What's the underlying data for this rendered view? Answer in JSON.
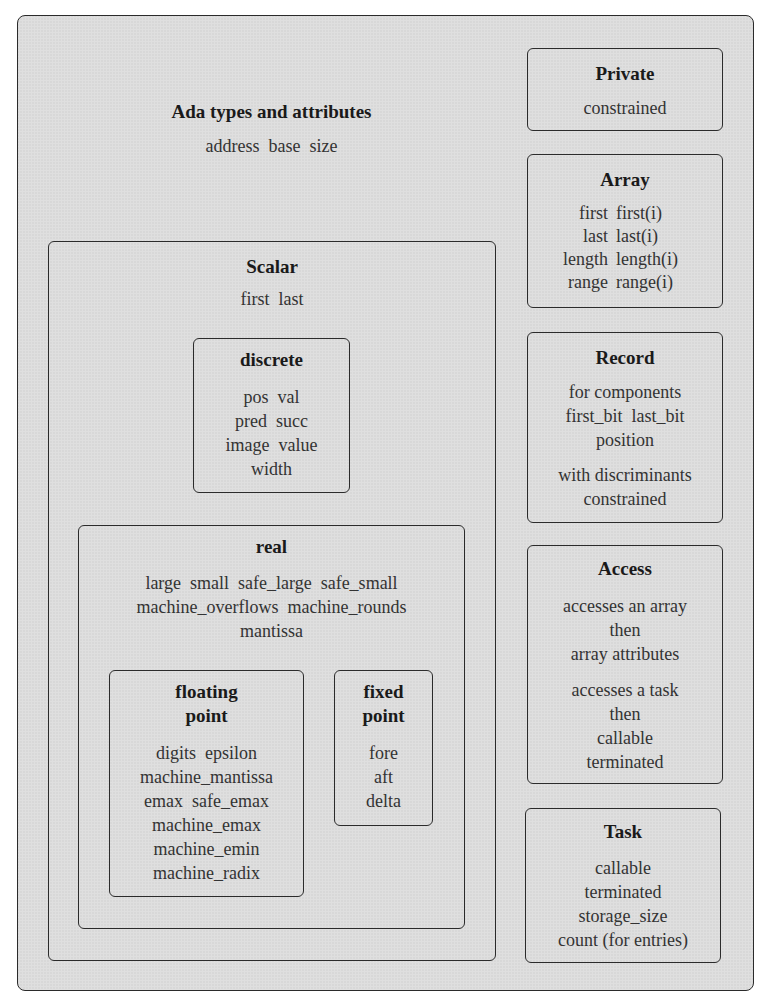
{
  "diagram": {
    "title": "Ada types and attributes",
    "common_attributes": [
      "address",
      "base",
      "size"
    ],
    "scalar": {
      "title": "Scalar",
      "attributes": [
        "first",
        "last"
      ],
      "discrete": {
        "title": "discrete",
        "lines": [
          "pos  val",
          "pred  succ",
          "image  value",
          "width"
        ]
      },
      "real": {
        "title": "real",
        "lines": [
          "large  small  safe_large  safe_small",
          "machine_overflows  machine_rounds",
          "mantissa"
        ],
        "floating_point": {
          "title_line1": "floating",
          "title_line2": "point",
          "lines": [
            "digits  epsilon",
            "machine_mantissa",
            "emax  safe_emax",
            "machine_emax",
            "machine_emin",
            "machine_radix"
          ]
        },
        "fixed_point": {
          "title_line1": "fixed",
          "title_line2": "point",
          "lines": [
            "fore",
            "aft",
            "delta"
          ]
        }
      }
    },
    "private": {
      "title": "Private",
      "lines": [
        "constrained"
      ]
    },
    "array": {
      "title": "Array",
      "rows": [
        {
          "left": "first",
          "right": "first(i)"
        },
        {
          "left": "last",
          "right": "last(i)"
        },
        {
          "left": "length",
          "right": "length(i)"
        },
        {
          "left": "range",
          "right": "range(i)"
        }
      ]
    },
    "record": {
      "title": "Record",
      "group1": [
        "for components",
        "first_bit  last_bit",
        "position"
      ],
      "group2": [
        "with discriminants",
        "constrained"
      ]
    },
    "access": {
      "title": "Access",
      "group1": [
        "accesses an array",
        "then",
        "array attributes"
      ],
      "group2": [
        "accesses a task",
        "then",
        "callable",
        "terminated"
      ]
    },
    "task": {
      "title": "Task",
      "lines": [
        "callable",
        "terminated",
        "storage_size",
        "count (for entries)"
      ]
    }
  }
}
